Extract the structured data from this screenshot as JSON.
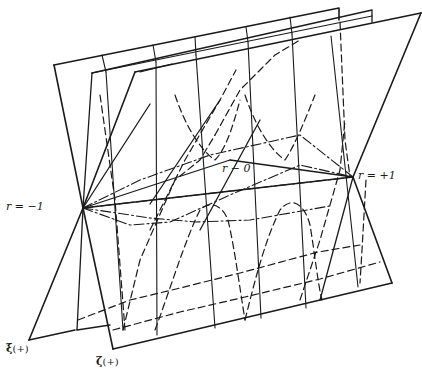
{
  "figure": {
    "labels": {
      "r_minus_1": "r = −1",
      "r_plus_1": "r = +1",
      "r_zero": "r − 0",
      "xi_symbol": "ξ",
      "xi_sign": "(+)",
      "zeta_symbol": "ζ",
      "zeta_sign": "(+)"
    },
    "colors": {
      "stroke": "#1a1a1a",
      "background": "#ffffff"
    },
    "planes": [
      {
        "name": "xi-plane",
        "points": [
          [
            54,
            65
          ],
          [
            339,
            8
          ],
          [
            312,
            290
          ],
          [
            29,
            340
          ]
        ]
      },
      {
        "name": "middle-plane",
        "points": [
          [
            92,
            73
          ],
          [
            372,
            10
          ],
          [
            352,
            280
          ],
          [
            77,
            330
          ]
        ]
      },
      {
        "name": "zeta-plane",
        "points": [
          [
            135,
            72
          ],
          [
            421,
            13
          ],
          [
            392,
            283
          ],
          [
            113,
            349
          ]
        ]
      }
    ],
    "special_points": {
      "r_minus_1": [
        83,
        208
      ],
      "r_plus_1": [
        353,
        177
      ]
    }
  }
}
